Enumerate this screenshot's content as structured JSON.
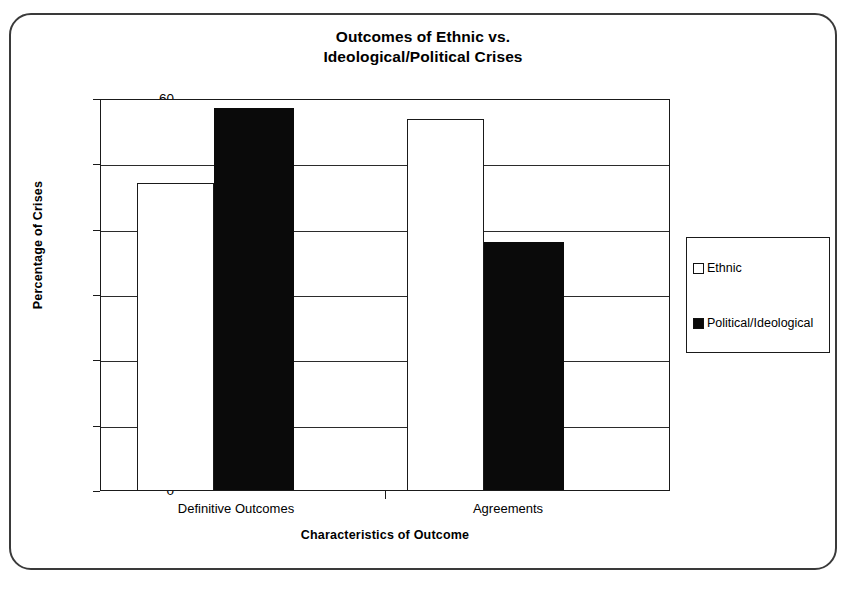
{
  "chart_data": {
    "type": "bar",
    "title": "Outcomes of Ethnic vs.\nIdeological/Political Crises",
    "title_line1": "Outcomes of Ethnic vs.",
    "title_line2": "Ideological/Political Crises",
    "xlabel": "Characteristics of Outcome",
    "ylabel": "Percentage of Crises",
    "categories": [
      "Definitive Outcomes",
      "Agreements"
    ],
    "series": [
      {
        "name": "Ethnic",
        "values": [
          47,
          56.8
        ],
        "color": "#ffffff",
        "swatch": "hollow"
      },
      {
        "name": "Political/Ideological",
        "values": [
          58.5,
          38
        ],
        "color": "#0a0a0a",
        "swatch": "filled"
      }
    ],
    "ylim": [
      0,
      60
    ],
    "yticks": [
      0,
      10,
      20,
      30,
      40,
      50,
      60
    ],
    "ytick_labels": [
      "0",
      "10",
      "20",
      "30",
      "40",
      "50",
      "60"
    ],
    "grid": true,
    "legend_position": "right",
    "legend_entries": [
      "Ethnic",
      "Political/Ideological"
    ]
  }
}
